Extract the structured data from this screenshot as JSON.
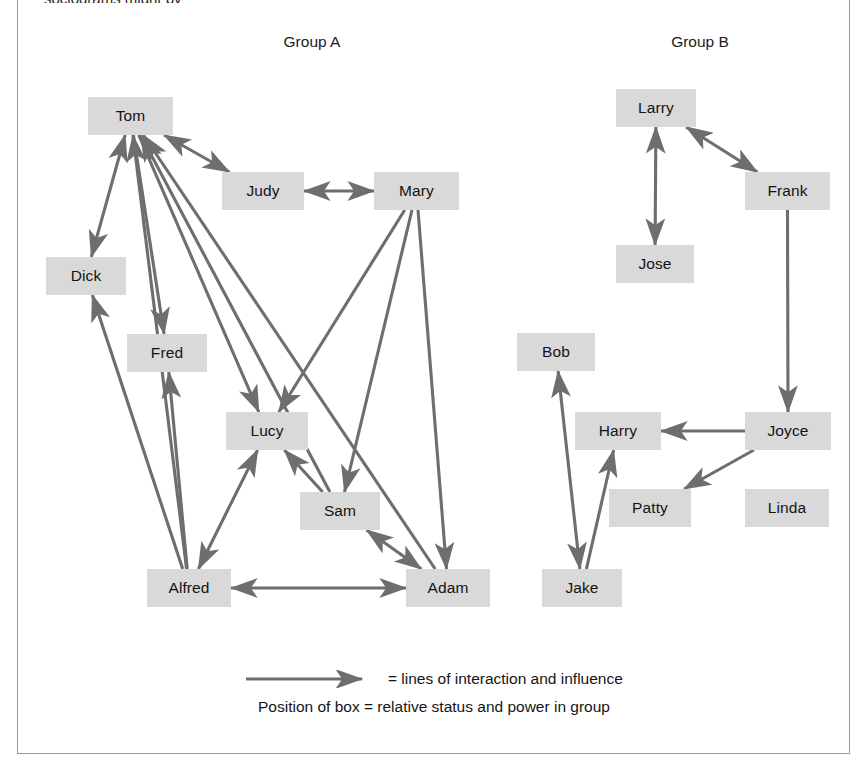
{
  "figure": {
    "clipped_top_text": "sociograms might by",
    "group_a_label": "Group A",
    "group_b_label": "Group B"
  },
  "legend": {
    "arrow_icon": "arrow-right-icon",
    "line_1": "= lines of interaction and influence",
    "line_2": "Position of box = relative status and power in group"
  },
  "colors": {
    "box_fill": "#d9d9d9",
    "edge_stroke": "#6e6e6e",
    "frame_border": "#9a9a9a",
    "text": "#141414",
    "page_background": "#ffffff"
  },
  "chart_data": {
    "type": "diagram",
    "diagram_kind": "sociogram",
    "groups": [
      {
        "name": "Group A",
        "label_x": 312,
        "label_y": 41,
        "members": [
          "Tom",
          "Judy",
          "Mary",
          "Dick",
          "Fred",
          "Lucy",
          "Sam",
          "Alfred",
          "Adam"
        ]
      },
      {
        "name": "Group B",
        "label_x": 700,
        "label_y": 41,
        "members": [
          "Larry",
          "Frank",
          "Jose",
          "Bob",
          "Harry",
          "Joyce",
          "Patty",
          "Linda",
          "Jake"
        ]
      }
    ],
    "nodes": [
      {
        "id": "tom",
        "label": "Tom",
        "group": "Group A",
        "x": 88,
        "y": 97,
        "w": 85,
        "h": 38
      },
      {
        "id": "judy",
        "label": "Judy",
        "group": "Group A",
        "x": 222,
        "y": 172,
        "w": 82,
        "h": 38
      },
      {
        "id": "mary",
        "label": "Mary",
        "group": "Group A",
        "x": 374,
        "y": 172,
        "w": 85,
        "h": 38
      },
      {
        "id": "dick",
        "label": "Dick",
        "group": "Group A",
        "x": 46,
        "y": 257,
        "w": 80,
        "h": 38
      },
      {
        "id": "fred",
        "label": "Fred",
        "group": "Group A",
        "x": 127,
        "y": 334,
        "w": 80,
        "h": 38
      },
      {
        "id": "lucy",
        "label": "Lucy",
        "group": "Group A",
        "x": 226,
        "y": 412,
        "w": 82,
        "h": 38
      },
      {
        "id": "sam",
        "label": "Sam",
        "group": "Group A",
        "x": 300,
        "y": 492,
        "w": 80,
        "h": 38
      },
      {
        "id": "alfred",
        "label": "Alfred",
        "group": "Group A",
        "x": 147,
        "y": 569,
        "w": 84,
        "h": 38
      },
      {
        "id": "adam",
        "label": "Adam",
        "group": "Group A",
        "x": 406,
        "y": 569,
        "w": 84,
        "h": 38
      },
      {
        "id": "larry",
        "label": "Larry",
        "group": "Group B",
        "x": 616,
        "y": 89,
        "w": 80,
        "h": 38
      },
      {
        "id": "frank",
        "label": "Frank",
        "group": "Group B",
        "x": 745,
        "y": 172,
        "w": 85,
        "h": 38
      },
      {
        "id": "jose",
        "label": "Jose",
        "group": "Group B",
        "x": 616,
        "y": 245,
        "w": 78,
        "h": 38
      },
      {
        "id": "bob",
        "label": "Bob",
        "group": "Group B",
        "x": 517,
        "y": 333,
        "w": 78,
        "h": 38
      },
      {
        "id": "harry",
        "label": "Harry",
        "group": "Group B",
        "x": 575,
        "y": 412,
        "w": 86,
        "h": 38
      },
      {
        "id": "joyce",
        "label": "Joyce",
        "group": "Group B",
        "x": 745,
        "y": 412,
        "w": 86,
        "h": 38
      },
      {
        "id": "patty",
        "label": "Patty",
        "group": "Group B",
        "x": 609,
        "y": 489,
        "w": 82,
        "h": 38
      },
      {
        "id": "linda",
        "label": "Linda",
        "group": "Group B",
        "x": 745,
        "y": 489,
        "w": 84,
        "h": 38
      },
      {
        "id": "jake",
        "label": "Jake",
        "group": "Group B",
        "x": 542,
        "y": 569,
        "w": 80,
        "h": 38
      }
    ],
    "edges": [
      {
        "from": "tom",
        "to": "judy",
        "direction": "both"
      },
      {
        "from": "tom",
        "to": "dick",
        "direction": "both"
      },
      {
        "from": "tom",
        "to": "fred",
        "direction": "forward"
      },
      {
        "from": "tom",
        "to": "lucy",
        "direction": "forward"
      },
      {
        "from": "alfred",
        "to": "tom",
        "direction": "forward"
      },
      {
        "from": "adam",
        "to": "tom",
        "direction": "forward"
      },
      {
        "from": "sam",
        "to": "tom",
        "direction": "forward"
      },
      {
        "from": "judy",
        "to": "mary",
        "direction": "both"
      },
      {
        "from": "mary",
        "to": "lucy",
        "direction": "forward"
      },
      {
        "from": "mary",
        "to": "sam",
        "direction": "forward"
      },
      {
        "from": "mary",
        "to": "adam",
        "direction": "forward"
      },
      {
        "from": "alfred",
        "to": "dick",
        "direction": "forward"
      },
      {
        "from": "alfred",
        "to": "fred",
        "direction": "forward"
      },
      {
        "from": "lucy",
        "to": "alfred",
        "direction": "both"
      },
      {
        "from": "sam",
        "to": "lucy",
        "direction": "forward"
      },
      {
        "from": "sam",
        "to": "adam",
        "direction": "both"
      },
      {
        "from": "alfred",
        "to": "adam",
        "direction": "both"
      },
      {
        "from": "larry",
        "to": "jose",
        "direction": "both"
      },
      {
        "from": "larry",
        "to": "frank",
        "direction": "both"
      },
      {
        "from": "frank",
        "to": "joyce",
        "direction": "forward"
      },
      {
        "from": "joyce",
        "to": "harry",
        "direction": "forward"
      },
      {
        "from": "joyce",
        "to": "patty",
        "direction": "forward"
      },
      {
        "from": "bob",
        "to": "jake",
        "direction": "both"
      },
      {
        "from": "jake",
        "to": "harry",
        "direction": "forward"
      }
    ],
    "isolates": [
      "Linda"
    ]
  }
}
